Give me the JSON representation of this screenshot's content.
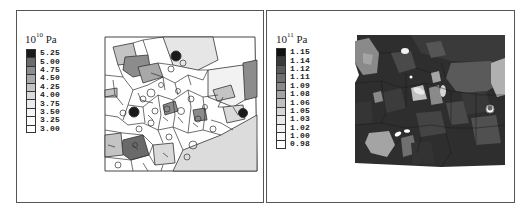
{
  "panels": [
    {
      "id": "left",
      "unit": {
        "base": "10",
        "exponent": "10",
        "suffix": "Pa"
      },
      "legend": {
        "values": [
          "5.25",
          "5.00",
          "4.75",
          "4.50",
          "4.25",
          "4.00",
          "3.75",
          "3.50",
          "3.25",
          "3.00"
        ],
        "colors": [
          "#1a1a1a",
          "#6a6a6a",
          "#8c8c8c",
          "#a8a8a8",
          "#c4c4c4",
          "#dadada",
          "#ebebeb",
          "#f4f4f4",
          "#fafafa",
          "#ffffff"
        ]
      }
    },
    {
      "id": "right",
      "unit": {
        "base": "10",
        "exponent": "11",
        "suffix": "Pa"
      },
      "legend": {
        "values": [
          "1.15",
          "1.14",
          "1.12",
          "1.11",
          "1.09",
          "1.08",
          "1.06",
          "1.05",
          "1.03",
          "1.02",
          "1.00",
          "0.98"
        ],
        "colors": [
          "#111111",
          "#3a3a3a",
          "#5a5a5a",
          "#707070",
          "#8a8a8a",
          "#a4a4a4",
          "#c0c0c0",
          "#d6d6d6",
          "#e8e8e8",
          "#f2f2f2",
          "#fafafa",
          "#ffffff"
        ]
      }
    }
  ]
}
